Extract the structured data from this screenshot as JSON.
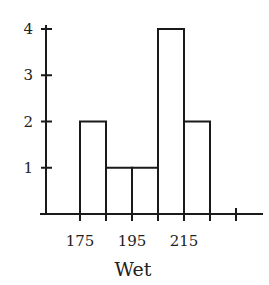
{
  "chart_data": {
    "type": "bar",
    "subtype": "histogram",
    "title": "",
    "xlabel": "Wet",
    "ylabel": "",
    "bin_edges": [
      175,
      185,
      195,
      205,
      215,
      225
    ],
    "categories": [
      "175-185",
      "185-195",
      "195-205",
      "205-215",
      "215-225"
    ],
    "values": [
      2,
      1,
      1,
      4,
      2
    ],
    "x_tick_labels": [
      "175",
      "195",
      "215"
    ],
    "x_tick_positions": [
      175,
      195,
      215
    ],
    "x_extra_tick": 235,
    "y_tick_labels": [
      "1",
      "2",
      "3",
      "4"
    ],
    "ylim": [
      0,
      4
    ],
    "xlim": [
      160,
      245
    ],
    "grid": false,
    "legend": null,
    "colors": {
      "bar_fill": "#ffffff",
      "bar_stroke": "#1a1a1a"
    }
  }
}
